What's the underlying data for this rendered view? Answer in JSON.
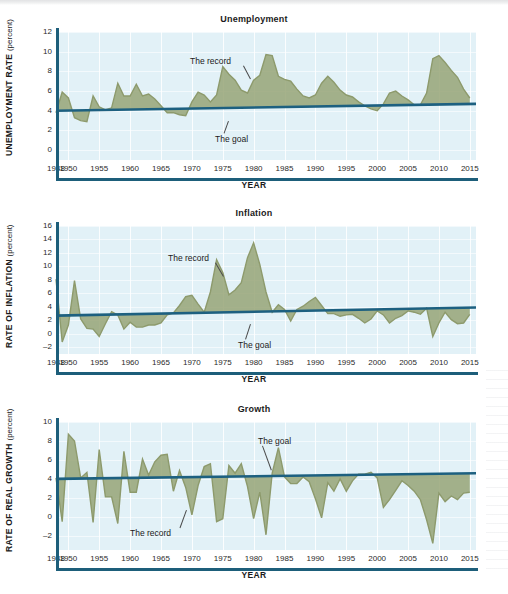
{
  "figure": {
    "axis_x_title": "YEAR",
    "goal_color": "#1d6080",
    "record_color": "#97a477",
    "plot_bg": "#e2f1f7",
    "axis_color": "#1d5e7a"
  },
  "annotations": {
    "record": "The record",
    "goal": "The goal"
  },
  "chart_data": [
    {
      "type": "area",
      "title": "Unemployment",
      "xlabel": "YEAR",
      "ylabel": "UNEMPLOYMENT RATE",
      "yunit": "(percent)",
      "ylim": [
        -1,
        12
      ],
      "xlim": [
        1948,
        2016
      ],
      "yticks": [
        12,
        10,
        8,
        6,
        4,
        2,
        0
      ],
      "xticks": [
        1948,
        1950,
        1955,
        1960,
        1965,
        1970,
        1975,
        1980,
        1985,
        1990,
        1995,
        2000,
        2005,
        2010,
        2015
      ],
      "grid": true,
      "legend": "none",
      "annotations": [
        {
          "text": "The record",
          "x": 1972,
          "y": 10.6
        },
        {
          "text": "The goal",
          "x": 1981,
          "y": 3.0
        }
      ],
      "series": [
        {
          "name": "The record",
          "x": [
            1948,
            1949,
            1950,
            1951,
            1952,
            1953,
            1954,
            1955,
            1956,
            1957,
            1958,
            1959,
            1960,
            1961,
            1962,
            1963,
            1964,
            1965,
            1966,
            1967,
            1968,
            1969,
            1970,
            1971,
            1972,
            1973,
            1974,
            1975,
            1976,
            1977,
            1978,
            1979,
            1980,
            1981,
            1982,
            1983,
            1984,
            1985,
            1986,
            1987,
            1988,
            1989,
            1990,
            1991,
            1992,
            1993,
            1994,
            1995,
            1996,
            1997,
            1998,
            1999,
            2000,
            2001,
            2002,
            2003,
            2004,
            2005,
            2006,
            2007,
            2008,
            2009,
            2010,
            2011,
            2012,
            2013,
            2014,
            2015
          ],
          "values": [
            3.8,
            5.9,
            5.3,
            3.3,
            3.0,
            2.9,
            5.5,
            4.4,
            4.1,
            4.3,
            6.8,
            5.5,
            5.5,
            6.7,
            5.5,
            5.7,
            5.2,
            4.5,
            3.8,
            3.8,
            3.6,
            3.5,
            4.9,
            5.9,
            5.6,
            4.9,
            5.6,
            8.5,
            7.7,
            7.1,
            6.1,
            5.8,
            7.1,
            7.6,
            9.7,
            9.6,
            7.5,
            7.2,
            7.0,
            6.2,
            5.5,
            5.3,
            5.6,
            6.8,
            7.5,
            6.9,
            6.1,
            5.6,
            5.4,
            4.9,
            4.5,
            4.2,
            4.0,
            4.7,
            5.8,
            6.0,
            5.5,
            5.1,
            4.6,
            4.6,
            5.8,
            9.3,
            9.6,
            8.9,
            8.1,
            7.4,
            6.2,
            5.3
          ]
        },
        {
          "name": "The goal",
          "x": [
            1948,
            2016
          ],
          "values": [
            4.0,
            4.7
          ]
        }
      ]
    },
    {
      "type": "area",
      "title": "Inflation",
      "xlabel": "YEAR",
      "ylabel": "RATE OF INFLATION",
      "yunit": "(percent)",
      "ylim": [
        -3,
        16
      ],
      "xlim": [
        1948,
        2016
      ],
      "yticks": [
        16,
        14,
        12,
        10,
        8,
        6,
        4,
        2,
        0,
        -2
      ],
      "xticks": [
        1948,
        1950,
        1955,
        1960,
        1965,
        1970,
        1975,
        1980,
        1985,
        1990,
        1995,
        2000,
        2005,
        2010,
        2015
      ],
      "grid": true,
      "legend": "none",
      "annotations": [
        {
          "text": "The record",
          "x": 1968,
          "y": 10.0
        },
        {
          "text": "The goal",
          "x": 1979,
          "y": 0.2
        }
      ],
      "series": [
        {
          "name": "The record",
          "x": [
            1948,
            1949,
            1950,
            1951,
            1952,
            1953,
            1954,
            1955,
            1956,
            1957,
            1958,
            1959,
            1960,
            1961,
            1962,
            1963,
            1964,
            1965,
            1966,
            1967,
            1968,
            1969,
            1970,
            1971,
            1972,
            1973,
            1974,
            1975,
            1976,
            1977,
            1978,
            1979,
            1980,
            1981,
            1982,
            1983,
            1984,
            1985,
            1986,
            1987,
            1988,
            1989,
            1990,
            1991,
            1992,
            1993,
            1994,
            1995,
            1996,
            1997,
            1998,
            1999,
            2000,
            2001,
            2002,
            2003,
            2004,
            2005,
            2006,
            2007,
            2008,
            2009,
            2010,
            2011,
            2012,
            2013,
            2014,
            2015
          ],
          "values": [
            8.1,
            -1.2,
            1.3,
            7.9,
            2.2,
            0.8,
            0.7,
            -0.4,
            1.5,
            3.3,
            2.8,
            0.7,
            1.7,
            1.0,
            1.0,
            1.3,
            1.3,
            1.6,
            2.8,
            3.1,
            4.2,
            5.5,
            5.7,
            4.4,
            3.2,
            6.2,
            11.0,
            9.1,
            5.8,
            6.5,
            7.6,
            11.3,
            13.5,
            10.3,
            6.2,
            3.2,
            4.3,
            3.6,
            1.9,
            3.6,
            4.1,
            4.8,
            5.4,
            4.2,
            3.0,
            3.0,
            2.6,
            2.8,
            2.9,
            2.3,
            1.6,
            2.2,
            3.4,
            2.8,
            1.6,
            2.3,
            2.7,
            3.4,
            3.2,
            2.9,
            3.8,
            -0.4,
            1.6,
            3.2,
            2.1,
            1.5,
            1.6,
            2.9
          ]
        },
        {
          "name": "The goal",
          "x": [
            1948,
            2016
          ],
          "values": [
            2.7,
            3.9
          ]
        }
      ]
    },
    {
      "type": "area",
      "title": "Growth",
      "xlabel": "YEAR",
      "ylabel": "RATE OF REAL GROWTH",
      "yunit": "(percent)",
      "ylim": [
        -3.5,
        10
      ],
      "xlim": [
        1948,
        2016
      ],
      "yticks": [
        10,
        8,
        6,
        4,
        2,
        0,
        -2
      ],
      "xticks": [
        1948,
        1950,
        1955,
        1960,
        1965,
        1970,
        1975,
        1980,
        1985,
        1990,
        1995,
        2000,
        2005,
        2010,
        2015
      ],
      "grid": true,
      "legend": "none",
      "annotations": [
        {
          "text": "The goal",
          "x": 1980,
          "y": 8.2
        },
        {
          "text": "The record",
          "x": 1967,
          "y": -2.3
        }
      ],
      "series": [
        {
          "name": "The record",
          "x": [
            1948,
            1949,
            1950,
            1951,
            1952,
            1953,
            1954,
            1955,
            1956,
            1957,
            1958,
            1959,
            1960,
            1961,
            1962,
            1963,
            1964,
            1965,
            1966,
            1967,
            1968,
            1969,
            1970,
            1971,
            1972,
            1973,
            1974,
            1975,
            1976,
            1977,
            1978,
            1979,
            1980,
            1981,
            1982,
            1983,
            1984,
            1985,
            1986,
            1987,
            1988,
            1989,
            1990,
            1991,
            1992,
            1993,
            1994,
            1995,
            1996,
            1997,
            1998,
            1999,
            2000,
            2001,
            2002,
            2003,
            2004,
            2005,
            2006,
            2007,
            2008,
            2009,
            2010,
            2011,
            2012,
            2013,
            2014,
            2015
          ],
          "values": [
            4.1,
            -0.5,
            8.7,
            8.0,
            4.1,
            4.7,
            -0.6,
            7.1,
            2.1,
            2.1,
            -0.7,
            6.9,
            2.6,
            2.6,
            6.1,
            4.4,
            5.8,
            6.5,
            6.6,
            2.7,
            4.9,
            3.1,
            0.2,
            3.3,
            5.3,
            5.6,
            -0.5,
            -0.2,
            5.4,
            4.6,
            5.6,
            3.2,
            -0.2,
            2.6,
            -1.9,
            4.6,
            7.3,
            4.2,
            3.5,
            3.5,
            4.2,
            3.7,
            1.9,
            -0.1,
            3.6,
            2.7,
            4.0,
            2.7,
            3.8,
            4.5,
            4.5,
            4.7,
            4.1,
            1.0,
            1.8,
            2.8,
            3.8,
            3.3,
            2.7,
            1.8,
            -0.3,
            -2.8,
            2.5,
            1.6,
            2.2,
            1.8,
            2.5,
            2.6
          ]
        },
        {
          "name": "The goal",
          "x": [
            1948,
            2016
          ],
          "values": [
            4.0,
            4.6
          ]
        }
      ]
    }
  ]
}
